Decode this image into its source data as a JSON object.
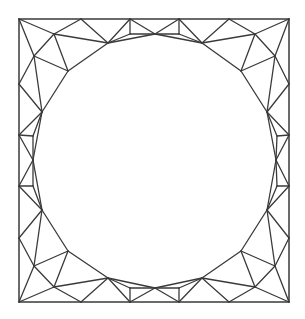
{
  "diagram": {
    "type": "triangular-mesh",
    "stroke_color": "#3a3a3a",
    "background_color": "#ffffff",
    "outer_boundary": {
      "shape": "square",
      "x_min": 19,
      "y_min": 19,
      "x_max": 289,
      "y_max": 302
    },
    "inner_boundary": {
      "shape": "circle-polygon",
      "center": [
        154.5,
        160.5
      ],
      "sides": 16
    },
    "vertices": {
      "c_tl": [
        19,
        19
      ],
      "t1": [
        81,
        19
      ],
      "t2": [
        130,
        19
      ],
      "t3": [
        179,
        19
      ],
      "t4": [
        229,
        19
      ],
      "c_tr": [
        289,
        19
      ],
      "r1": [
        289,
        84
      ],
      "r2": [
        289,
        135
      ],
      "r3": [
        289,
        186
      ],
      "r4": [
        289,
        238
      ],
      "c_br": [
        289,
        302
      ],
      "b4": [
        229,
        302
      ],
      "b3": [
        179,
        302
      ],
      "b2": [
        130,
        302
      ],
      "b1": [
        81,
        302
      ],
      "c_bl": [
        19,
        302
      ],
      "l4": [
        19,
        238
      ],
      "l3": [
        19,
        186
      ],
      "l2": [
        19,
        135
      ],
      "l1": [
        19,
        84
      ],
      "h0": [
        155,
        34
      ],
      "h1": [
        202,
        43
      ],
      "h2": [
        241,
        71
      ],
      "h3": [
        267,
        112
      ],
      "h4": [
        276,
        160
      ],
      "h5": [
        267,
        210
      ],
      "h6": [
        241,
        251
      ],
      "h7": [
        202,
        278
      ],
      "h8": [
        155,
        288
      ],
      "h9": [
        108,
        278
      ],
      "h10": [
        68,
        251
      ],
      "h11": [
        42,
        210
      ],
      "h12": [
        33,
        160
      ],
      "h13": [
        42,
        112
      ],
      "h14": [
        68,
        71
      ],
      "h15": [
        108,
        43
      ],
      "m_tl1": [
        54,
        34
      ],
      "m_tl2": [
        34,
        56
      ],
      "m_t1": [
        130,
        34
      ],
      "m_t2": [
        179,
        34
      ],
      "m_tr1": [
        255,
        34
      ],
      "m_tr2": [
        275,
        56
      ],
      "m_r1": [
        277,
        136
      ],
      "m_r2": [
        277,
        186
      ],
      "m_br1": [
        275,
        266
      ],
      "m_br2": [
        255,
        287
      ],
      "m_b2": [
        179,
        288
      ],
      "m_b1": [
        130,
        288
      ],
      "m_bl1": [
        54,
        287
      ],
      "m_bl2": [
        34,
        266
      ],
      "m_l2": [
        33,
        186
      ],
      "m_l1": [
        33,
        136
      ]
    },
    "outer_edges": [
      [
        "c_tl",
        "t1"
      ],
      [
        "t1",
        "t2"
      ],
      [
        "t2",
        "t3"
      ],
      [
        "t3",
        "t4"
      ],
      [
        "t4",
        "c_tr"
      ],
      [
        "c_tr",
        "r1"
      ],
      [
        "r1",
        "r2"
      ],
      [
        "r2",
        "r3"
      ],
      [
        "r3",
        "r4"
      ],
      [
        "r4",
        "c_br"
      ],
      [
        "c_br",
        "b4"
      ],
      [
        "b4",
        "b3"
      ],
      [
        "b3",
        "b2"
      ],
      [
        "b2",
        "b1"
      ],
      [
        "b1",
        "c_bl"
      ],
      [
        "c_bl",
        "l4"
      ],
      [
        "l4",
        "l3"
      ],
      [
        "l3",
        "l2"
      ],
      [
        "l2",
        "l1"
      ],
      [
        "l1",
        "c_tl"
      ]
    ],
    "hole_edges": [
      [
        "h0",
        "h1"
      ],
      [
        "h1",
        "h2"
      ],
      [
        "h2",
        "h3"
      ],
      [
        "h3",
        "h4"
      ],
      [
        "h4",
        "h5"
      ],
      [
        "h5",
        "h6"
      ],
      [
        "h6",
        "h7"
      ],
      [
        "h7",
        "h8"
      ],
      [
        "h8",
        "h9"
      ],
      [
        "h9",
        "h10"
      ],
      [
        "h10",
        "h11"
      ],
      [
        "h11",
        "h12"
      ],
      [
        "h12",
        "h13"
      ],
      [
        "h13",
        "h14"
      ],
      [
        "h14",
        "h15"
      ],
      [
        "h15",
        "h0"
      ]
    ],
    "interior_edges": [
      [
        "c_tl",
        "m_tl1"
      ],
      [
        "c_tl",
        "m_tl2"
      ],
      [
        "t1",
        "m_tl1"
      ],
      [
        "t1",
        "h15"
      ],
      [
        "m_tl1",
        "h15"
      ],
      [
        "m_tl1",
        "m_tl2"
      ],
      [
        "m_tl1",
        "h14"
      ],
      [
        "m_tl2",
        "h14"
      ],
      [
        "m_tl2",
        "l1"
      ],
      [
        "m_tl2",
        "h13"
      ],
      [
        "l1",
        "h13"
      ],
      [
        "t2",
        "h15"
      ],
      [
        "t2",
        "m_t1"
      ],
      [
        "t2",
        "h0"
      ],
      [
        "m_t1",
        "h15"
      ],
      [
        "m_t1",
        "h0"
      ],
      [
        "t3",
        "h0"
      ],
      [
        "t3",
        "m_t2"
      ],
      [
        "t3",
        "h1"
      ],
      [
        "m_t2",
        "h0"
      ],
      [
        "m_t2",
        "h1"
      ],
      [
        "t4",
        "h1"
      ],
      [
        "t4",
        "m_tr1"
      ],
      [
        "c_tr",
        "m_tr1"
      ],
      [
        "c_tr",
        "m_tr2"
      ],
      [
        "m_tr1",
        "h1"
      ],
      [
        "m_tr1",
        "m_tr2"
      ],
      [
        "m_tr1",
        "h2"
      ],
      [
        "m_tr2",
        "h2"
      ],
      [
        "m_tr2",
        "r1"
      ],
      [
        "m_tr2",
        "h3"
      ],
      [
        "r1",
        "h3"
      ],
      [
        "r2",
        "h3"
      ],
      [
        "r2",
        "m_r1"
      ],
      [
        "r2",
        "h4"
      ],
      [
        "m_r1",
        "h3"
      ],
      [
        "m_r1",
        "h4"
      ],
      [
        "r3",
        "h4"
      ],
      [
        "r3",
        "m_r2"
      ],
      [
        "r3",
        "h5"
      ],
      [
        "m_r2",
        "h4"
      ],
      [
        "m_r2",
        "h5"
      ],
      [
        "r4",
        "h5"
      ],
      [
        "r4",
        "m_br1"
      ],
      [
        "c_br",
        "m_br1"
      ],
      [
        "c_br",
        "m_br2"
      ],
      [
        "m_br1",
        "h5"
      ],
      [
        "m_br1",
        "m_br2"
      ],
      [
        "m_br1",
        "h6"
      ],
      [
        "m_br2",
        "h6"
      ],
      [
        "m_br2",
        "b4"
      ],
      [
        "m_br2",
        "h7"
      ],
      [
        "b4",
        "h7"
      ],
      [
        "b3",
        "h7"
      ],
      [
        "b3",
        "m_b2"
      ],
      [
        "b3",
        "h8"
      ],
      [
        "m_b2",
        "h7"
      ],
      [
        "m_b2",
        "h8"
      ],
      [
        "b2",
        "h8"
      ],
      [
        "b2",
        "m_b1"
      ],
      [
        "b2",
        "h9"
      ],
      [
        "m_b1",
        "h8"
      ],
      [
        "m_b1",
        "h9"
      ],
      [
        "b1",
        "h9"
      ],
      [
        "b1",
        "m_bl1"
      ],
      [
        "c_bl",
        "m_bl1"
      ],
      [
        "c_bl",
        "m_bl2"
      ],
      [
        "m_bl1",
        "h9"
      ],
      [
        "m_bl1",
        "m_bl2"
      ],
      [
        "m_bl1",
        "h10"
      ],
      [
        "m_bl2",
        "h10"
      ],
      [
        "m_bl2",
        "l4"
      ],
      [
        "m_bl2",
        "h11"
      ],
      [
        "l4",
        "h11"
      ],
      [
        "l3",
        "h11"
      ],
      [
        "l3",
        "m_l2"
      ],
      [
        "l3",
        "h12"
      ],
      [
        "m_l2",
        "h11"
      ],
      [
        "m_l2",
        "h12"
      ],
      [
        "l2",
        "h12"
      ],
      [
        "l2",
        "m_l1"
      ],
      [
        "l2",
        "h13"
      ],
      [
        "m_l1",
        "h12"
      ],
      [
        "m_l1",
        "h13"
      ]
    ]
  }
}
